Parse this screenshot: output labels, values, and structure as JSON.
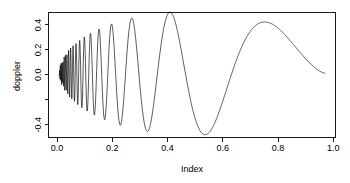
{
  "chart_data": {
    "type": "line",
    "title": "",
    "xlabel": "Index",
    "ylabel": "doppler",
    "xlim": [
      -0.04,
      1.04
    ],
    "ylim": [
      -0.52,
      0.49
    ],
    "grid": false,
    "legend": null,
    "curve_color": "#000000",
    "background_color": "#ffffff",
    "frame_color": "#000000",
    "function": "sqrt(x*(1-x)) * sin(2*pi*(1+eps)/(x+eps))",
    "epsilon": 0.05,
    "n_points": 1024,
    "x_ticks": [
      0.0,
      0.2,
      0.4,
      0.6,
      0.8,
      1.0
    ],
    "x_tick_labels": [
      "0.0",
      "0.2",
      "0.4",
      "0.6",
      "0.8",
      "1.0"
    ],
    "y_ticks": [
      0.4,
      0.2,
      0.0,
      -0.2,
      -0.4
    ],
    "y_tick_labels": [
      "0.4",
      "0.2",
      "0.0",
      "",
      "-0.4"
    ],
    "annotations": [],
    "notable_extrema": [
      {
        "x": 0.772,
        "y": 0.403,
        "kind": "local-max"
      },
      {
        "x": 0.545,
        "y": -0.487,
        "kind": "local-min"
      },
      {
        "x": 0.414,
        "y": 0.458,
        "kind": "local-max"
      },
      {
        "x": 0.33,
        "y": -0.468,
        "kind": "local-min"
      },
      {
        "x": 0.269,
        "y": 0.425,
        "kind": "local-max"
      },
      {
        "x": 0.229,
        "y": -0.418,
        "kind": "local-min"
      },
      {
        "x": 0.198,
        "y": 0.383,
        "kind": "local-max"
      },
      {
        "x": 1.0,
        "y": 0.0,
        "kind": "endpoint"
      },
      {
        "x": 0.0,
        "y": 0.0,
        "kind": "endpoint"
      }
    ]
  },
  "axes": {
    "y_axis_title": "doppler",
    "x_axis_title": "Index"
  }
}
